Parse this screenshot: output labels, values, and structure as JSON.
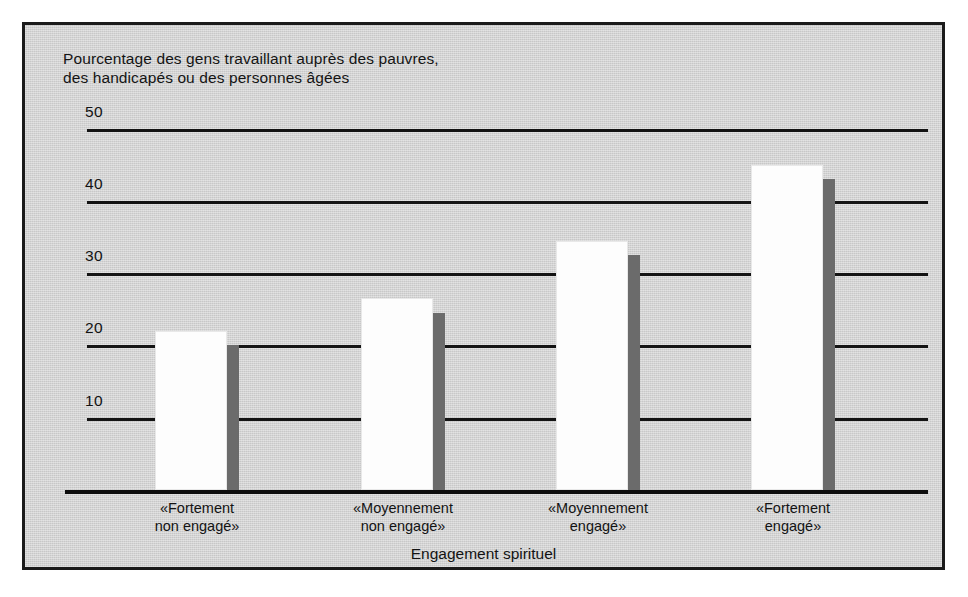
{
  "chart_data": {
    "type": "bar",
    "title": "Pourcentage des gens travaillant auprès des pauvres,\ndes handicapés ou des personnes âgées",
    "xlabel": "Engagement spirituel",
    "ylabel": "",
    "categories": [
      "«Fortement\nnon engagé»",
      "«Moyennement\nnon engagé»",
      "«Moyennement\nengagé»",
      "«Fortement\nengagé»"
    ],
    "values": [
      22,
      26.5,
      34.5,
      45
    ],
    "shadow_values": [
      20,
      24.5,
      32.5,
      43
    ],
    "ylim": [
      0,
      50
    ],
    "yticks": [
      10,
      20,
      30,
      40,
      50
    ],
    "ytick_labels": [
      "10",
      "20",
      "30",
      "40",
      "50"
    ],
    "grid": true,
    "legend": "none",
    "bar_color": "#fdfdfd",
    "shadow_color": "#6b6b6b",
    "axis_color": "#131313",
    "plot_background": "#d6d6d6"
  }
}
